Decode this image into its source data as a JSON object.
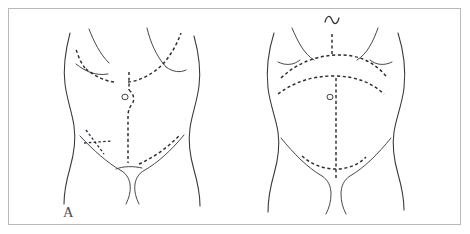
{
  "figure": {
    "caption": "",
    "background_color": "#ffffff",
    "frame_color": "#b9b9b9",
    "ink_color": "#2b2b33",
    "outline_color": "#35353b"
  },
  "panels": [
    {
      "id": "A",
      "label": "A",
      "description": "Anterior abdominal wall with marked incision lines",
      "anatomy": [
        "left-torso-contour",
        "right-torso-contour",
        "left-costal-margin",
        "right-costal-margin",
        "left-inguinal-crease",
        "right-inguinal-crease",
        "pubic-line",
        "umbilicus"
      ],
      "incisions": [
        {
          "name": "left-subcostal-incision",
          "style": "dashed",
          "orientation": "oblique"
        },
        {
          "name": "right-subcostal-incision",
          "style": "dashed",
          "orientation": "oblique"
        },
        {
          "name": "midline-incision",
          "style": "dashed",
          "orientation": "vertical",
          "note": "curves around umbilicus"
        },
        {
          "name": "gridiron-mcburney-incision",
          "style": "dashed",
          "orientation": "oblique"
        },
        {
          "name": "transverse-muscle-splitting-incision",
          "style": "dashed",
          "orientation": "horizontal"
        },
        {
          "name": "right-lower-oblique-incision",
          "style": "dashed",
          "orientation": "oblique"
        }
      ]
    },
    {
      "id": "B",
      "label": "B",
      "description": "Anterior abdominal wall with transverse and chevron incision lines",
      "anatomy": [
        "left-torso-contour",
        "right-torso-contour",
        "left-costal-margin",
        "right-costal-margin",
        "left-inguinal-crease",
        "right-inguinal-crease",
        "umbilicus",
        "xiphoid-mark"
      ],
      "incisions": [
        {
          "name": "upper-chevron-rooftop-incision",
          "style": "dashed",
          "orientation": "arched"
        },
        {
          "name": "upper-transverse-incision",
          "style": "dashed",
          "orientation": "arched"
        },
        {
          "name": "midline-incision",
          "style": "dashed",
          "orientation": "vertical"
        },
        {
          "name": "pfannenstiel-incision",
          "style": "dashed",
          "orientation": "curved"
        },
        {
          "name": "xiphoid-marker",
          "style": "wavy",
          "orientation": "horizontal"
        }
      ]
    }
  ]
}
